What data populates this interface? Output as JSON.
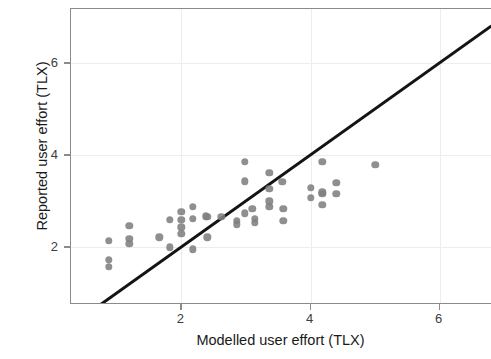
{
  "chart_data": {
    "type": "scatter",
    "title": "",
    "xlabel": "Modelled user effort (TLX)",
    "ylabel": "Reported user effort (TLX)",
    "xlim": [
      0.29,
      6.81
    ],
    "ylim": [
      0.75,
      7.18
    ],
    "xticks": [
      2,
      4,
      6
    ],
    "xtick_labels": [
      "2",
      "4",
      "6"
    ],
    "yticks": [
      2,
      4,
      6
    ],
    "ytick_labels": [
      "2",
      "4",
      "6"
    ],
    "grid": true,
    "legend": "none",
    "point_color": "#808080",
    "line_color": "#141414",
    "panel_border_color": "#8b8b8b",
    "grid_color": "#ededed",
    "reference_line": {
      "name": "identity-line",
      "kind": "line",
      "slope": 1,
      "intercept": 0,
      "x_start": 0.72,
      "y_start": 0.72,
      "x_end": 6.81,
      "y_end": 6.81,
      "width_px": 3
    },
    "points": [
      {
        "x": 0.88,
        "y": 2.15
      },
      {
        "x": 0.88,
        "y": 1.73
      },
      {
        "x": 0.88,
        "y": 1.58
      },
      {
        "x": 1.19,
        "y": 2.47
      },
      {
        "x": 1.19,
        "y": 2.19
      },
      {
        "x": 1.19,
        "y": 2.08
      },
      {
        "x": 1.66,
        "y": 2.22
      },
      {
        "x": 1.82,
        "y": 2.6
      },
      {
        "x": 1.82,
        "y": 2.0
      },
      {
        "x": 2.0,
        "y": 2.78
      },
      {
        "x": 2.0,
        "y": 2.6
      },
      {
        "x": 2.0,
        "y": 2.44
      },
      {
        "x": 2.0,
        "y": 2.3
      },
      {
        "x": 2.18,
        "y": 2.88
      },
      {
        "x": 2.18,
        "y": 2.62
      },
      {
        "x": 2.18,
        "y": 1.96
      },
      {
        "x": 2.38,
        "y": 2.68
      },
      {
        "x": 2.4,
        "y": 2.66
      },
      {
        "x": 2.4,
        "y": 2.22
      },
      {
        "x": 2.62,
        "y": 2.66
      },
      {
        "x": 2.86,
        "y": 2.58
      },
      {
        "x": 2.86,
        "y": 2.5
      },
      {
        "x": 2.98,
        "y": 3.86
      },
      {
        "x": 2.98,
        "y": 3.44
      },
      {
        "x": 2.98,
        "y": 2.74
      },
      {
        "x": 3.1,
        "y": 2.84
      },
      {
        "x": 3.14,
        "y": 2.62
      },
      {
        "x": 3.14,
        "y": 2.54
      },
      {
        "x": 3.36,
        "y": 3.62
      },
      {
        "x": 3.36,
        "y": 3.28
      },
      {
        "x": 3.36,
        "y": 3.0
      },
      {
        "x": 3.36,
        "y": 2.88
      },
      {
        "x": 3.56,
        "y": 3.42
      },
      {
        "x": 3.58,
        "y": 2.84
      },
      {
        "x": 3.58,
        "y": 2.58
      },
      {
        "x": 4.0,
        "y": 3.3
      },
      {
        "x": 4.0,
        "y": 3.08
      },
      {
        "x": 4.18,
        "y": 3.86
      },
      {
        "x": 4.18,
        "y": 3.2
      },
      {
        "x": 4.18,
        "y": 3.16
      },
      {
        "x": 4.18,
        "y": 2.92
      },
      {
        "x": 4.4,
        "y": 3.4
      },
      {
        "x": 4.4,
        "y": 3.16
      },
      {
        "x": 5.0,
        "y": 3.8
      }
    ]
  }
}
